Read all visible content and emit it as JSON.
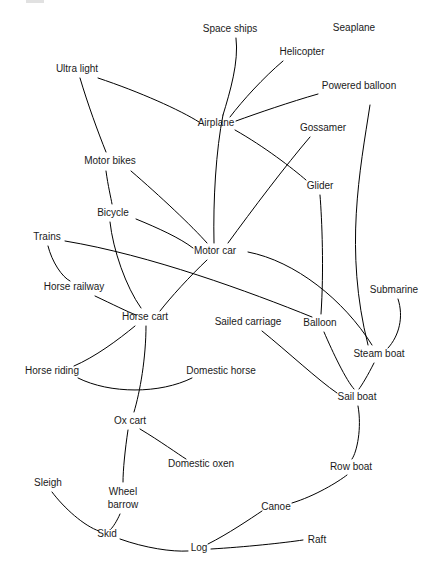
{
  "figure": {
    "type": "network-diagram",
    "title": "",
    "width": 441,
    "height": 579,
    "background_color": "#ffffff",
    "line_color": "#000000",
    "text_color": "#1a1a1a"
  },
  "nodes": [
    {
      "id": "space_ships",
      "label": "Space ships",
      "x": 230,
      "y": 29
    },
    {
      "id": "seaplane",
      "label": "Seaplane",
      "x": 354,
      "y": 28
    },
    {
      "id": "helicopter",
      "label": "Helicopter",
      "x": 302,
      "y": 52
    },
    {
      "id": "ultra_light",
      "label": "Ultra light",
      "x": 77,
      "y": 69
    },
    {
      "id": "powered_balloon",
      "label": "Powered balloon",
      "x": 359,
      "y": 86
    },
    {
      "id": "airplane",
      "label": "Airplane",
      "x": 216,
      "y": 123
    },
    {
      "id": "gossamer",
      "label": "Gossamer",
      "x": 323,
      "y": 128
    },
    {
      "id": "motor_bikes",
      "label": "Motor bikes",
      "x": 110,
      "y": 161
    },
    {
      "id": "glider",
      "label": "Glider",
      "x": 320,
      "y": 186
    },
    {
      "id": "bicycle",
      "label": "Bicycle",
      "x": 113,
      "y": 213
    },
    {
      "id": "trains",
      "label": "Trains",
      "x": 47,
      "y": 237
    },
    {
      "id": "motor_car",
      "label": "Motor car",
      "x": 215,
      "y": 251
    },
    {
      "id": "horse_railway",
      "label": "Horse railway",
      "x": 74,
      "y": 287
    },
    {
      "id": "submarine",
      "label": "Submarine",
      "x": 394,
      "y": 290
    },
    {
      "id": "horse_cart",
      "label": "Horse cart",
      "x": 145,
      "y": 317
    },
    {
      "id": "sailed_carriage",
      "label": "Sailed carriage",
      "x": 248,
      "y": 322
    },
    {
      "id": "balloon",
      "label": "Balloon",
      "x": 320,
      "y": 323
    },
    {
      "id": "steam_boat",
      "label": "Steam boat",
      "x": 379,
      "y": 354
    },
    {
      "id": "horse_riding",
      "label": "Horse riding",
      "x": 52,
      "y": 371
    },
    {
      "id": "domestic_horse",
      "label": "Domestic horse",
      "x": 221,
      "y": 371
    },
    {
      "id": "sail_boat",
      "label": "Sail boat",
      "x": 357,
      "y": 397
    },
    {
      "id": "ox_cart",
      "label": "Ox cart",
      "x": 130,
      "y": 421
    },
    {
      "id": "domestic_oxen",
      "label": "Domestic oxen",
      "x": 201,
      "y": 464
    },
    {
      "id": "row_boat",
      "label": "Row boat",
      "x": 351,
      "y": 467
    },
    {
      "id": "sleigh",
      "label": "Sleigh",
      "x": 48,
      "y": 483
    },
    {
      "id": "wheel_barrow",
      "label": "Wheel",
      "label2": "barrow",
      "x": 123,
      "y": 492
    },
    {
      "id": "canoe",
      "label": "Canoe",
      "x": 276,
      "y": 507
    },
    {
      "id": "skid",
      "label": "Skid",
      "x": 107,
      "y": 534
    },
    {
      "id": "raft",
      "label": "Raft",
      "x": 317,
      "y": 540
    },
    {
      "id": "log",
      "label": "Log",
      "x": 199,
      "y": 548
    }
  ],
  "edges": [
    {
      "from": "space_ships",
      "to": "airplane",
      "path": "M 236 38 C 239 62, 230 92, 223 115"
    },
    {
      "from": "space_ships",
      "to": "motor_car",
      "path": "M 223 115 C 216 150, 213 200, 214 243"
    },
    {
      "from": "helicopter",
      "to": "airplane",
      "path": "M 283 61 C 263 78, 243 100, 230 117"
    },
    {
      "from": "powered_balloon",
      "to": "airplane",
      "path": "M 318 94 C 290 102, 258 113, 236 121"
    },
    {
      "from": "ultra_light",
      "to": "airplane",
      "path": "M 98 78 C 140 92, 180 110, 199 122"
    },
    {
      "from": "ultra_light",
      "to": "motor_bikes",
      "path": "M 80 78 C 88 105, 98 132, 106 152"
    },
    {
      "from": "seaplane",
      "to": "steam_boat",
      "path": "M 370 105 C 360 170, 344 250, 368 345"
    },
    {
      "from": "airplane",
      "to": "glider",
      "path": "M 235 130 C 265 147, 292 168, 306 180"
    },
    {
      "from": "gossamer",
      "to": "motor_car",
      "path": "M 310 137 C 286 165, 252 210, 228 243"
    },
    {
      "from": "motor_bikes",
      "to": "bicycle",
      "path": "M 106 171 C 108 186, 111 198, 112 204"
    },
    {
      "from": "motor_bikes",
      "to": "motor_car",
      "path": "M 131 171 C 160 196, 192 226, 207 243"
    },
    {
      "from": "bicycle",
      "to": "motor_car",
      "path": "M 136 219 C 158 228, 180 238, 193 248"
    },
    {
      "from": "bicycle",
      "to": "horse_cart",
      "path": "M 110 222 C 113 250, 126 287, 141 308"
    },
    {
      "from": "trains",
      "to": "horse_railway",
      "path": "M 48 246 C 52 262, 62 277, 70 281"
    },
    {
      "from": "trains",
      "to": "balloon",
      "path": "M 65 241 C 150 255, 250 292, 312 317"
    },
    {
      "from": "motor_car",
      "to": "horse_cart",
      "path": "M 207 260 C 190 276, 170 298, 160 311"
    },
    {
      "from": "motor_car",
      "to": "steam_boat",
      "path": "M 248 252 C 295 261, 344 300, 372 345"
    },
    {
      "from": "horse_railway",
      "to": "horse_cart",
      "path": "M 95 296 C 112 304, 128 312, 136 315"
    },
    {
      "from": "horse_cart",
      "to": "horse_riding",
      "path": "M 135 326 C 118 340, 95 357, 74 366"
    },
    {
      "from": "horse_cart",
      "to": "ox_cart",
      "path": "M 146 326 C 146 358, 140 392, 134 412"
    },
    {
      "from": "horse_riding",
      "to": "domestic_horse",
      "path": "M 78 378 C 110 394, 160 394, 192 378"
    },
    {
      "from": "sailed_carriage",
      "to": "sail_boat",
      "path": "M 262 331 C 288 352, 318 380, 337 393"
    },
    {
      "from": "balloon",
      "to": "glider",
      "path": "M 321 314 C 324 270, 322 220, 320 195"
    },
    {
      "from": "balloon",
      "to": "sail_boat",
      "path": "M 324 332 C 333 353, 346 380, 354 389"
    },
    {
      "from": "submarine",
      "to": "steam_boat",
      "path": "M 398 299 C 404 317, 399 336, 388 348"
    },
    {
      "from": "steam_boat",
      "to": "sail_boat",
      "path": "M 374 363 C 368 375, 362 385, 359 389"
    },
    {
      "from": "sail_boat",
      "to": "row_boat",
      "path": "M 358 406 C 362 428, 357 452, 352 459"
    },
    {
      "from": "ox_cart",
      "to": "domestic_oxen",
      "path": "M 140 429 C 160 441, 178 454, 186 459"
    },
    {
      "from": "ox_cart",
      "to": "wheel_barrow",
      "path": "M 128 430 C 125 450, 123 470, 123 482"
    },
    {
      "from": "sleigh",
      "to": "skid",
      "path": "M 52 492 C 64 508, 84 526, 99 531"
    },
    {
      "from": "wheel_barrow",
      "to": "skid",
      "path": "M 120 514 C 117 521, 113 527, 111 529"
    },
    {
      "from": "skid",
      "to": "log",
      "path": "M 120 539 C 145 548, 172 552, 188 551"
    },
    {
      "from": "log",
      "to": "canoe",
      "path": "M 208 544 C 228 534, 250 519, 262 511"
    },
    {
      "from": "log",
      "to": "raft",
      "path": "M 211 549 C 245 547, 283 543, 303 540"
    },
    {
      "from": "canoe",
      "to": "row_boat",
      "path": "M 292 503 C 315 496, 338 482, 347 475"
    }
  ]
}
